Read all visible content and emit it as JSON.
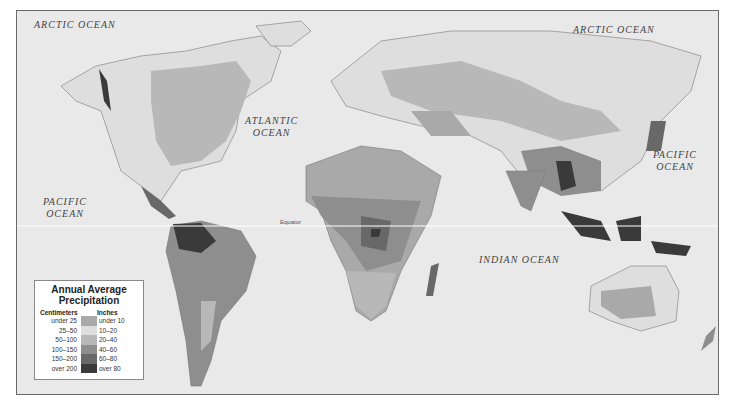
{
  "map": {
    "title": "Annual Average Precipitation",
    "ocean_labels": [
      {
        "id": "arctic-west",
        "text": "ARCTIC OCEAN"
      },
      {
        "id": "arctic-east",
        "text": "ARCTIC OCEAN"
      },
      {
        "id": "atlantic",
        "line1": "ATLANTIC",
        "line2": "OCEAN"
      },
      {
        "id": "pacific-west",
        "line1": "PACIFIC",
        "line2": "OCEAN"
      },
      {
        "id": "pacific-east",
        "line1": "PACIFIC",
        "line2": "OCEAN"
      },
      {
        "id": "indian",
        "text": "INDIAN OCEAN"
      }
    ],
    "equator_label": "Equator"
  },
  "legend": {
    "title_line1": "Annual Average",
    "title_line2": "Precipitation",
    "centimeters_header": "Centimeters",
    "inches_header": "Inches",
    "rows": [
      {
        "cm": "under 25",
        "in": "under 10",
        "color": "#a9a9a9"
      },
      {
        "cm": "25–50",
        "in": "10–20",
        "color": "#dedede"
      },
      {
        "cm": "50–100",
        "in": "20–40",
        "color": "#b8b8b8"
      },
      {
        "cm": "100–150",
        "in": "40–60",
        "color": "#8e8e8e"
      },
      {
        "cm": "150–200",
        "in": "60–80",
        "color": "#686868"
      },
      {
        "cm": "over 200",
        "in": "over 80",
        "color": "#3a3a3a"
      }
    ]
  }
}
